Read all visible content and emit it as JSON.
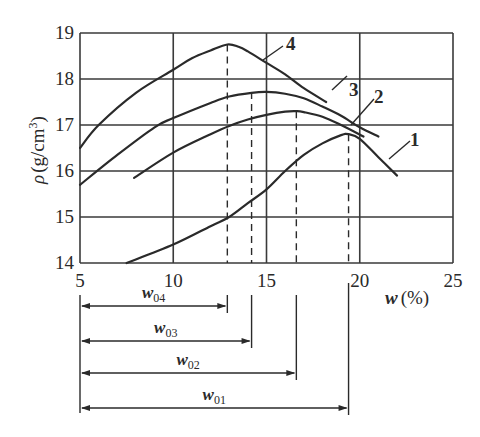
{
  "chart_data": {
    "type": "line",
    "title": "",
    "xlabel": "w (%)",
    "ylabel": "ρ (g/cm³)",
    "xlim": [
      5,
      25
    ],
    "ylim": [
      14,
      19
    ],
    "x_ticks": [
      "5",
      "10",
      "15",
      "20",
      "25"
    ],
    "y_ticks": [
      "14",
      "15",
      "16",
      "17",
      "18",
      "19"
    ],
    "grid": true,
    "legend": "inline numeric labels on curves",
    "series": [
      {
        "name": "1",
        "x": [
          7.5,
          10,
          12,
          13,
          14,
          15,
          16,
          17,
          18,
          19,
          19.4,
          20,
          21,
          22
        ],
        "y": [
          14.0,
          14.4,
          14.8,
          15.0,
          15.3,
          15.6,
          16.0,
          16.35,
          16.6,
          16.78,
          16.8,
          16.7,
          16.3,
          15.9
        ],
        "peak": {
          "x": 19.4,
          "y": 16.8
        }
      },
      {
        "name": "2",
        "x": [
          7.9,
          10,
          12,
          13,
          14,
          15,
          16,
          16.6,
          17,
          18,
          19,
          20.2
        ],
        "y": [
          15.85,
          16.4,
          16.8,
          16.98,
          17.12,
          17.22,
          17.29,
          17.3,
          17.28,
          17.18,
          17.0,
          16.75
        ],
        "peak": {
          "x": 16.6,
          "y": 17.3
        }
      },
      {
        "name": "3",
        "x": [
          5.0,
          7,
          9,
          10,
          12,
          13,
          14.2,
          15,
          16,
          17,
          18,
          19,
          20,
          21
        ],
        "y": [
          15.7,
          16.35,
          16.95,
          17.15,
          17.48,
          17.62,
          17.7,
          17.72,
          17.68,
          17.58,
          17.4,
          17.2,
          16.95,
          16.75
        ],
        "peak": {
          "x": 14.2,
          "y": 17.72
        }
      },
      {
        "name": "4",
        "x": [
          5.0,
          6,
          8,
          10,
          11,
          12,
          12.9,
          13.5,
          14,
          15,
          16,
          17,
          18.2
        ],
        "y": [
          16.5,
          17.0,
          17.7,
          18.2,
          18.45,
          18.62,
          18.75,
          18.7,
          18.6,
          18.35,
          18.1,
          17.8,
          17.5
        ],
        "peak": {
          "x": 12.9,
          "y": 18.75
        }
      }
    ],
    "annotations": [
      {
        "label": "w04",
        "base": "w",
        "sub": "04",
        "from_x": 5,
        "to_x": 12.9
      },
      {
        "label": "w03",
        "base": "w",
        "sub": "03",
        "from_x": 5,
        "to_x": 14.2
      },
      {
        "label": "w02",
        "base": "w",
        "sub": "02",
        "from_x": 5,
        "to_x": 16.6
      },
      {
        "label": "w01",
        "base": "w",
        "sub": "01",
        "from_x": 5,
        "to_x": 19.4
      }
    ]
  },
  "labels": {
    "ylabel_rho": "ρ",
    "ylabel_units": "(g/cm",
    "ylabel_sup": "3",
    "ylabel_close": ")",
    "xlabel_var": "w",
    "xlabel_units": "(%)"
  },
  "colors": {
    "line": "#2a2a2a",
    "grid": "#3a3a3a",
    "background": "#ffffff"
  }
}
